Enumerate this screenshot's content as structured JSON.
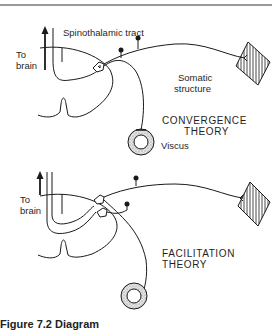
{
  "figure": {
    "caption": "Figure 7.2  Diagram",
    "panels": [
      {
        "name": "convergence",
        "title_line1": "CONVERGENCE",
        "title_line2": "THEORY",
        "labels": {
          "to_brain_1": "To",
          "to_brain_2": "brain",
          "tract": "Spinothalamic tract",
          "somatic_1": "Somatic",
          "somatic_2": "structure",
          "viscus": "Viscus"
        }
      },
      {
        "name": "facilitation",
        "title_line1": "FACILITATION",
        "title_line2": "THEORY",
        "labels": {
          "to_brain_1": "To",
          "to_brain_2": "brain"
        }
      }
    ],
    "colors": {
      "line": "#1a1a1a",
      "stipple": "#bdbdbd",
      "rule": "#9a9a9a"
    }
  }
}
